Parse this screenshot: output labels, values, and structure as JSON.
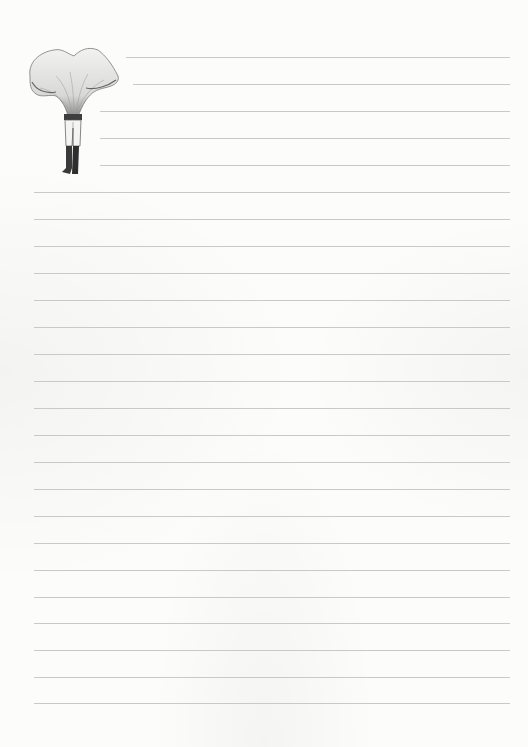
{
  "page": {
    "type": "lined-notepaper",
    "paper_color": "#fcfcfb",
    "line_color": "#c9c9c7"
  },
  "illustration": {
    "subject": "mushroom-headed figure with legs and boots",
    "style": "grayscale engraving"
  },
  "lines": {
    "count": 25,
    "spacing_px": 27,
    "first_y": 57,
    "short_lines": [
      {
        "y": 57,
        "x_start": 126
      },
      {
        "y": 84,
        "x_start": 133
      },
      {
        "y": 111,
        "x_start": 100
      },
      {
        "y": 138,
        "x_start": 100
      },
      {
        "y": 165,
        "x_start": 100
      }
    ],
    "full_x_start": 34,
    "x_end": 510
  }
}
